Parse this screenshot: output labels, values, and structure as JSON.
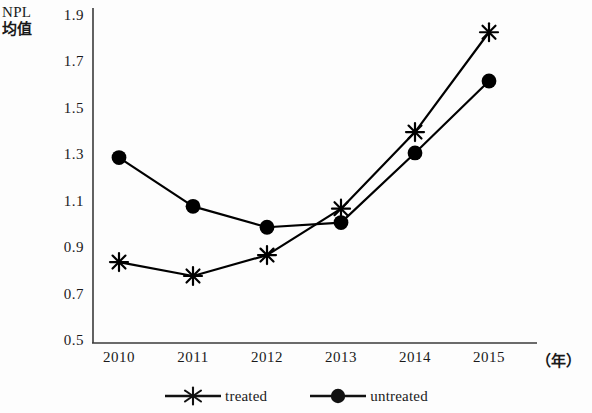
{
  "chart_data": {
    "type": "line",
    "title": "",
    "ylabel_line1": "NPL",
    "ylabel_line2": "均值",
    "xlabel": "（年）",
    "categories": [
      "2010",
      "2011",
      "2012",
      "2013",
      "2014",
      "2015"
    ],
    "ylim": [
      0.5,
      1.9
    ],
    "yticks": [
      "0.5",
      "0.7",
      "0.9",
      "1.1",
      "1.3",
      "1.5",
      "1.7",
      "1.9"
    ],
    "ytick_values": [
      0.5,
      0.7,
      0.9,
      1.1,
      1.3,
      1.5,
      1.7,
      1.9
    ],
    "grid": false,
    "legend_position": "bottom-center",
    "series": [
      {
        "name": "treated",
        "marker": "asterisk",
        "color": "#000000",
        "values": [
          0.84,
          0.78,
          0.87,
          1.07,
          1.4,
          1.83
        ]
      },
      {
        "name": "untreated",
        "marker": "filled-circle",
        "color": "#000000",
        "values": [
          1.29,
          1.08,
          0.99,
          1.01,
          1.31,
          1.62
        ]
      }
    ]
  },
  "legend": {
    "entries": [
      {
        "label": "treated",
        "marker": "asterisk-marker-icon"
      },
      {
        "label": "untreated",
        "marker": "circle-marker-icon"
      }
    ]
  },
  "colors": {
    "axis": "#3a3a3a",
    "series": "#111111",
    "background": "#fdfdfd"
  }
}
